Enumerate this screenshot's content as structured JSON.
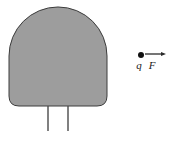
{
  "figure": {
    "background_color": "#ffffff",
    "width": 170,
    "height": 141,
    "body": {
      "name": "charged-conductor",
      "shape": "circle-with-flat-bottom",
      "fill_color": "#9d9d9d",
      "stroke_color": "#3c3c3c",
      "stroke_width": 1,
      "center_x": 58,
      "center_y": 56,
      "radius": 49,
      "flat_bottom_y": 106,
      "left_x": 9,
      "right_x": 107,
      "top_y": 7
    },
    "leads": {
      "name": "support-leads",
      "count": 2,
      "stroke_color": "#4a4a4a",
      "stroke_width": 1.4,
      "top_y": 106,
      "bottom_y": 131,
      "x_positions": [
        48,
        68
      ]
    },
    "point_charge": {
      "name": "point-charge",
      "label": "q",
      "dot_color": "#111111",
      "dot_radius": 3,
      "x": 141,
      "y": 55,
      "label_x": 139,
      "label_y": 69
    },
    "force_vector": {
      "name": "force-vector",
      "label": "F",
      "stroke_color": "#2b2b2b",
      "stroke_width": 1.3,
      "start_x": 145,
      "end_x": 166,
      "y": 54,
      "arrowhead_length": 5,
      "arrowhead_width": 4,
      "label_x": 152,
      "label_y": 69
    }
  }
}
